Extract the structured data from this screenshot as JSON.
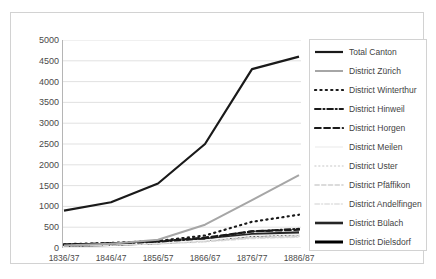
{
  "chart_data": {
    "type": "line",
    "title": "",
    "subtitle": "",
    "xlabel": "",
    "ylabel": "",
    "x": [
      "1836/37",
      "1846/47",
      "1856/57",
      "1866/67",
      "1876/77",
      "1886/87"
    ],
    "categories": [
      "1836/37",
      "1846/47",
      "1856/57",
      "1866/67",
      "1876/77",
      "1886/87"
    ],
    "ylim": [
      0,
      5000
    ],
    "ytick_labels": [
      "0",
      "500",
      "1000",
      "1500",
      "2000",
      "2500",
      "3000",
      "3500",
      "4000",
      "4500",
      "5000"
    ],
    "ytick_values": [
      0,
      500,
      1000,
      1500,
      2000,
      2500,
      3000,
      3500,
      4000,
      4500,
      5000
    ],
    "grid": true,
    "grid_color": "#d9d9d9",
    "legend_position": "right",
    "series": [
      {
        "name": "Total Canton",
        "values": [
          900,
          1100,
          1550,
          2500,
          4300,
          4600
        ],
        "color": "#1a1a1a",
        "style": "solid",
        "width": 2.2
      },
      {
        "name": "District Zürich",
        "values": [
          60,
          100,
          200,
          560,
          1150,
          1750
        ],
        "color": "#a6a6a6",
        "style": "solid",
        "width": 2.0
      },
      {
        "name": "District Winterthur",
        "values": [
          90,
          120,
          170,
          300,
          630,
          800
        ],
        "color": "#1a1a1a",
        "style": "dotted",
        "width": 2.2
      },
      {
        "name": "District Hinweil",
        "values": [
          80,
          110,
          150,
          230,
          400,
          460
        ],
        "color": "#1a1a1a",
        "style": "dashdot",
        "width": 2.0
      },
      {
        "name": "District Horgen",
        "values": [
          80,
          110,
          160,
          250,
          400,
          440
        ],
        "color": "#1a1a1a",
        "style": "dashed",
        "width": 2.2
      },
      {
        "name": "District Meilen",
        "values": [
          70,
          90,
          130,
          190,
          300,
          330
        ],
        "color": "#f2f2f2",
        "style": "solid",
        "width": 1.6
      },
      {
        "name": "District Uster",
        "values": [
          60,
          80,
          120,
          180,
          280,
          310
        ],
        "color": "#d9d9d9",
        "style": "dotted",
        "width": 1.6
      },
      {
        "name": "District Pfäffikon",
        "values": [
          55,
          75,
          110,
          160,
          250,
          280
        ],
        "color": "#d0d0d0",
        "style": "dashed",
        "width": 1.6
      },
      {
        "name": "District Andelfingen",
        "values": [
          50,
          70,
          100,
          150,
          230,
          260
        ],
        "color": "#e0e0e0",
        "style": "dashdot",
        "width": 1.6
      },
      {
        "name": "District Bülach",
        "values": [
          70,
          95,
          140,
          210,
          330,
          370
        ],
        "color": "#262626",
        "style": "solid",
        "width": 2.6
      },
      {
        "name": "District Dielsdorf",
        "values": [
          60,
          85,
          125,
          190,
          300,
          340
        ],
        "color": "#000000",
        "style": "solid",
        "width": 3.0
      }
    ]
  },
  "legend": {
    "items": [
      {
        "label": "Total Canton"
      },
      {
        "label": "District Zürich"
      },
      {
        "label": "District Winterthur"
      },
      {
        "label": "District Hinweil"
      },
      {
        "label": "District Horgen"
      },
      {
        "label": "District Meilen"
      },
      {
        "label": "District Uster"
      },
      {
        "label": "District Pfäffikon"
      },
      {
        "label": "District Andelfingen"
      },
      {
        "label": "District Bülach"
      },
      {
        "label": "District Dielsdorf"
      }
    ]
  }
}
